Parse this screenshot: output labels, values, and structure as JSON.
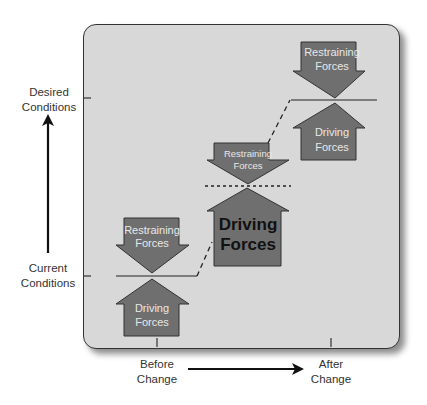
{
  "y_axis": {
    "top_label": [
      "Desired",
      "Conditions"
    ],
    "bottom_label": [
      "Current",
      "Conditions"
    ],
    "arrow_icon": "arrow-up-icon"
  },
  "x_axis": {
    "left_label": [
      "Before",
      "Change"
    ],
    "right_label": [
      "After",
      "Change"
    ],
    "arrow_icon": "arrow-right-icon"
  },
  "stages": [
    {
      "name": "before-change",
      "restraining": [
        "Restraining",
        "Forces"
      ],
      "driving": [
        "Driving",
        "Forces"
      ],
      "equilibrium_line": "solid"
    },
    {
      "name": "during-change",
      "restraining": [
        "Restraining",
        "Forces"
      ],
      "driving": [
        "Driving",
        "Forces"
      ],
      "equilibrium_line": "dotted",
      "driving_emphasized": true
    },
    {
      "name": "after-change",
      "restraining": [
        "Restraining",
        "Forces"
      ],
      "driving": [
        "Driving",
        "Forces"
      ],
      "equilibrium_line": "solid"
    }
  ],
  "colors": {
    "panel_background": "#d8d8d8",
    "arrow_fill": "#6f6f6f",
    "arrow_stroke": "#333333",
    "arrow_text": "#e8e8e8",
    "emphasis_text": "#111111"
  }
}
